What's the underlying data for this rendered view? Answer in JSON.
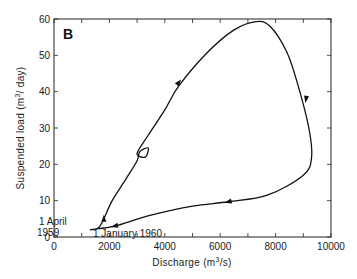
{
  "chart_data": {
    "type": "line",
    "panel_label": "B",
    "title": "",
    "xlabel": "Discharge (m3/s)",
    "ylabel": "Suspended load (m3/day)",
    "xlim": [
      0,
      10000
    ],
    "ylim": [
      0,
      60
    ],
    "x_ticks": [
      0,
      2000,
      4000,
      6000,
      8000,
      10000
    ],
    "y_ticks": [
      0,
      10,
      20,
      30,
      40,
      50,
      60
    ],
    "grid": false,
    "legend": null,
    "annotations": [
      {
        "text_line1": "1 April",
        "text_line2": "1959",
        "x": 1300,
        "y": 2
      },
      {
        "text": "1 January 1960",
        "x": 2100,
        "y": 2.5
      }
    ],
    "series": [
      {
        "name": "Hysteresis loop (1 April 1959 – 1 January 1960)",
        "direction": "clockwise",
        "points": [
          {
            "x": 1300,
            "y": 2.0
          },
          {
            "x": 1600,
            "y": 2.5
          },
          {
            "x": 1800,
            "y": 5.0
          },
          {
            "x": 2100,
            "y": 10.0
          },
          {
            "x": 2600,
            "y": 16.0
          },
          {
            "x": 3000,
            "y": 21.0
          },
          {
            "x": 3100,
            "y": 23.5
          },
          {
            "x": 3400,
            "y": 24.5
          },
          {
            "x": 3300,
            "y": 22.0
          },
          {
            "x": 3000,
            "y": 23.0
          },
          {
            "x": 3400,
            "y": 28.0
          },
          {
            "x": 4000,
            "y": 35.0
          },
          {
            "x": 4500,
            "y": 41.5
          },
          {
            "x": 5500,
            "y": 50.5
          },
          {
            "x": 6500,
            "y": 57.0
          },
          {
            "x": 7300,
            "y": 59.3
          },
          {
            "x": 7800,
            "y": 58.0
          },
          {
            "x": 8400,
            "y": 51.0
          },
          {
            "x": 8800,
            "y": 42.0
          },
          {
            "x": 9200,
            "y": 30.0
          },
          {
            "x": 9300,
            "y": 22.0
          },
          {
            "x": 9000,
            "y": 17.0
          },
          {
            "x": 7700,
            "y": 11.5
          },
          {
            "x": 6300,
            "y": 9.7
          },
          {
            "x": 5000,
            "y": 8.5
          },
          {
            "x": 3500,
            "y": 6.0
          },
          {
            "x": 2200,
            "y": 3.0
          },
          {
            "x": 1600,
            "y": 2.3
          },
          {
            "x": 1300,
            "y": 2.0
          }
        ],
        "arrows_at": [
          {
            "x": 1800,
            "y": 5.0,
            "dir": "up"
          },
          {
            "x": 4500,
            "y": 42.5,
            "dir": "up-right"
          },
          {
            "x": 9100,
            "y": 38.0,
            "dir": "down"
          },
          {
            "x": 6300,
            "y": 9.7,
            "dir": "left"
          },
          {
            "x": 2200,
            "y": 3.0,
            "dir": "left"
          }
        ]
      }
    ]
  }
}
